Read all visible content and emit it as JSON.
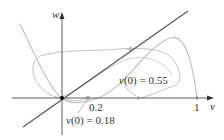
{
  "axes": {
    "x_label": "v",
    "y_label": "w",
    "x_ticks": [
      {
        "value": 0.2,
        "label": "0.2"
      },
      {
        "value": 1,
        "label": "1"
      }
    ]
  },
  "annotations": {
    "traj_small": {
      "var": "v",
      "eq": "(0) = 0.18"
    },
    "traj_large": {
      "var": "v",
      "eq": "(0) = 0.55"
    }
  },
  "colors": {
    "axis": "#333333",
    "nullcline_line": "#555555",
    "curves": "#b8b8b8",
    "fixed_point": "#000000"
  },
  "curves": [
    {
      "name": "w-nullcline",
      "kind": "straight line through origin"
    },
    {
      "name": "v-nullcline",
      "kind": "cubic"
    },
    {
      "name": "trajectory",
      "v0": 0.18
    },
    {
      "name": "trajectory",
      "v0": 0.55
    }
  ]
}
